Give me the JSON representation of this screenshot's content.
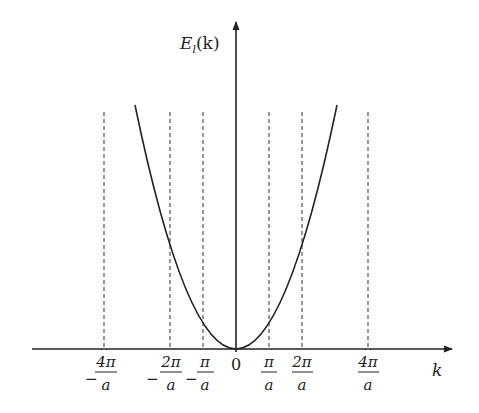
{
  "diagram": {
    "y_axis_label": "E_l(k)",
    "y_axis_label_main": "E",
    "y_axis_label_sub": "l",
    "y_axis_label_arg": "(k)",
    "x_axis_label": "k",
    "origin_label": "0",
    "curve": "parabola E = k^2, vertex at origin",
    "ticks": [
      {
        "id": "neg4",
        "sign": "−",
        "numerator": "4π",
        "denominator": "a",
        "value": "-4π/a"
      },
      {
        "id": "neg2",
        "sign": "−",
        "numerator": "2π",
        "denominator": "a",
        "value": "-2π/a"
      },
      {
        "id": "neg1",
        "sign": "−",
        "numerator": "π",
        "denominator": "a",
        "value": "-π/a"
      },
      {
        "id": "pos1",
        "sign": "",
        "numerator": "π",
        "denominator": "a",
        "value": "π/a"
      },
      {
        "id": "pos2",
        "sign": "",
        "numerator": "2π",
        "denominator": "a",
        "value": "2π/a"
      },
      {
        "id": "pos4",
        "sign": "",
        "numerator": "4π",
        "denominator": "a",
        "value": "4π/a"
      }
    ],
    "colors": {
      "stroke": "#222222",
      "background": "#ffffff"
    }
  }
}
